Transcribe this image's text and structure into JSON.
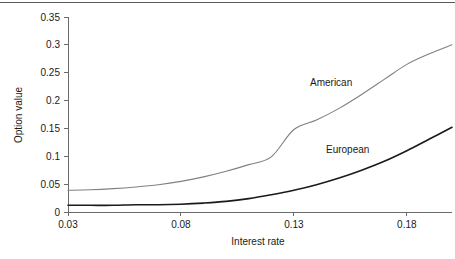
{
  "figure": {
    "background_color": "#ffffff",
    "top_rule_color": "#5a5a5a",
    "axis_color": "#6b6b6b",
    "text_color": "#1a1a1a"
  },
  "labels": {
    "xlabel": "Interest rate",
    "ylabel": "Option value",
    "american": "American",
    "european": "European"
  },
  "chart_data": {
    "type": "line",
    "title": "",
    "xlabel": "Interest rate",
    "ylabel": "Option value",
    "xlim": [
      0.03,
      0.2
    ],
    "ylim": [
      0,
      0.35
    ],
    "xticks": [
      0.03,
      0.08,
      0.13,
      0.18
    ],
    "xtick_labels": [
      "0.03",
      "0.08",
      "0.13",
      "0.18"
    ],
    "yticks": [
      0,
      0.05,
      0.1,
      0.15,
      0.2,
      0.25,
      0.3,
      0.35
    ],
    "ytick_labels": [
      "0",
      "0.05",
      "0.1",
      "0.15",
      "0.2",
      "0.25",
      "0.3",
      "0.35"
    ],
    "grid": false,
    "legend": "inline-annotations",
    "x": [
      0.03,
      0.04,
      0.05,
      0.06,
      0.07,
      0.08,
      0.09,
      0.1,
      0.11,
      0.12,
      0.13,
      0.14,
      0.15,
      0.16,
      0.17,
      0.18,
      0.19,
      0.2
    ],
    "series": [
      {
        "name": "American",
        "color": "#808080",
        "line_width": 1.1,
        "label_position": {
          "x": 0.118,
          "y": 0.235
        },
        "values": [
          0.039,
          0.04,
          0.042,
          0.045,
          0.049,
          0.055,
          0.063,
          0.073,
          0.085,
          0.099,
          0.148,
          0.165,
          0.186,
          0.211,
          0.238,
          0.265,
          0.284,
          0.3
        ]
      },
      {
        "name": "European",
        "color": "#1a1a1a",
        "line_width": 1.6,
        "label_position": {
          "x": 0.137,
          "y": 0.118
        },
        "values": [
          0.012,
          0.012,
          0.012,
          0.013,
          0.013,
          0.014,
          0.016,
          0.019,
          0.024,
          0.031,
          0.039,
          0.049,
          0.061,
          0.075,
          0.091,
          0.11,
          0.131,
          0.152
        ]
      }
    ]
  }
}
